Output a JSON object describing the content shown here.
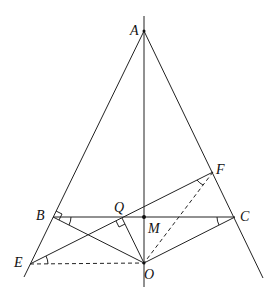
{
  "diagram": {
    "type": "geometry",
    "points": {
      "A": {
        "label": "A",
        "x": 144,
        "y": 31
      },
      "B": {
        "label": "B",
        "x": 53,
        "y": 217
      },
      "C": {
        "label": "C",
        "x": 235,
        "y": 217
      },
      "M": {
        "label": "M",
        "x": 144,
        "y": 217
      },
      "O": {
        "label": "O",
        "x": 144,
        "y": 263
      },
      "E": {
        "label": "E",
        "x": 30,
        "y": 264
      },
      "F": {
        "label": "F",
        "x": 213,
        "y": 172
      },
      "Q": {
        "label": "Q",
        "x": 122,
        "y": 218
      }
    },
    "segments_solid": [
      "AE-extended",
      "AC-extended",
      "AO-extended",
      "BC",
      "EF",
      "BO",
      "QO",
      "CO"
    ],
    "segments_dashed": [
      "EO",
      "FO"
    ],
    "right_angles": [
      "ABO at B",
      "OQF at Q"
    ],
    "equal_angle_marks": [
      "CBO",
      "BCO",
      "FEO",
      "EFO"
    ]
  }
}
